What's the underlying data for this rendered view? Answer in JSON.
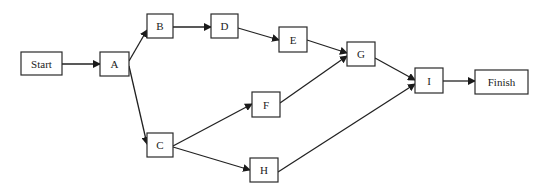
{
  "diagram": {
    "type": "network-activity-diagram",
    "nodes": [
      {
        "id": "start",
        "label": "Start",
        "x": 21,
        "y": 52,
        "w": 41,
        "h": 23
      },
      {
        "id": "a",
        "label": "A",
        "x": 100,
        "y": 52,
        "w": 29,
        "h": 24
      },
      {
        "id": "b",
        "label": "B",
        "x": 147,
        "y": 14,
        "w": 26,
        "h": 24
      },
      {
        "id": "d",
        "label": "D",
        "x": 211,
        "y": 14,
        "w": 27,
        "h": 24
      },
      {
        "id": "e",
        "label": "E",
        "x": 279,
        "y": 27,
        "w": 28,
        "h": 25
      },
      {
        "id": "g",
        "label": "G",
        "x": 347,
        "y": 42,
        "w": 28,
        "h": 24
      },
      {
        "id": "i",
        "label": "I",
        "x": 415,
        "y": 68,
        "w": 28,
        "h": 25
      },
      {
        "id": "finish",
        "label": "Finish",
        "x": 475,
        "y": 70,
        "w": 53,
        "h": 24
      },
      {
        "id": "c",
        "label": "C",
        "x": 147,
        "y": 133,
        "w": 26,
        "h": 24
      },
      {
        "id": "f",
        "label": "F",
        "x": 252,
        "y": 92,
        "w": 28,
        "h": 25
      },
      {
        "id": "h",
        "label": "H",
        "x": 250,
        "y": 158,
        "w": 28,
        "h": 24
      }
    ],
    "edges": [
      {
        "from": "start",
        "to": "a",
        "x1": 62,
        "y1": 64,
        "x2": 100,
        "y2": 64
      },
      {
        "from": "a",
        "to": "b",
        "x1": 129,
        "y1": 61,
        "x2": 147,
        "y2": 30
      },
      {
        "from": "a",
        "to": "c",
        "x1": 129,
        "y1": 66,
        "x2": 147,
        "y2": 144
      },
      {
        "from": "b",
        "to": "d",
        "x1": 173,
        "y1": 27,
        "x2": 211,
        "y2": 27
      },
      {
        "from": "d",
        "to": "e",
        "x1": 238,
        "y1": 28,
        "x2": 279,
        "y2": 40
      },
      {
        "from": "e",
        "to": "g",
        "x1": 307,
        "y1": 40,
        "x2": 347,
        "y2": 53
      },
      {
        "from": "f",
        "to": "g",
        "x1": 280,
        "y1": 103,
        "x2": 347,
        "y2": 56
      },
      {
        "from": "g",
        "to": "i",
        "x1": 375,
        "y1": 58,
        "x2": 415,
        "y2": 80
      },
      {
        "from": "h",
        "to": "i",
        "x1": 278,
        "y1": 172,
        "x2": 415,
        "y2": 84
      },
      {
        "from": "i",
        "to": "finish",
        "x1": 443,
        "y1": 81,
        "x2": 475,
        "y2": 81
      },
      {
        "from": "c",
        "to": "f",
        "x1": 173,
        "y1": 146,
        "x2": 252,
        "y2": 104
      },
      {
        "from": "c",
        "to": "h",
        "x1": 173,
        "y1": 147,
        "x2": 250,
        "y2": 170
      }
    ]
  }
}
